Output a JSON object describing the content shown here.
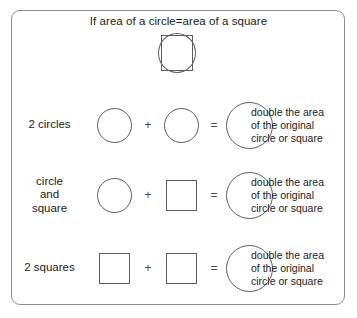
{
  "title": "If area of a circle=area of a square",
  "colors": {
    "stroke": "#5d5d5d",
    "frame": "#8d8d8d",
    "text": "#1b1b1b",
    "background": "#ffffff"
  },
  "top_figure": {
    "square_label": "square",
    "circle_label": "circle"
  },
  "operators": {
    "plus": "+",
    "equals": "="
  },
  "rows": [
    {
      "label": "2 circles",
      "left_shape": "circle",
      "right_shape": "circle",
      "result_shape": "circle",
      "result_text": "double the area\nof the original\ncircle or square"
    },
    {
      "label": "circle\nand\nsquare",
      "left_shape": "circle",
      "right_shape": "square",
      "result_shape": "circle",
      "result_text": "double the area\nof the original\ncircle or square"
    },
    {
      "label": "2 squares",
      "left_shape": "square",
      "right_shape": "square",
      "result_shape": "circle",
      "result_text": "double the area\nof the original\ncircle or square"
    }
  ]
}
